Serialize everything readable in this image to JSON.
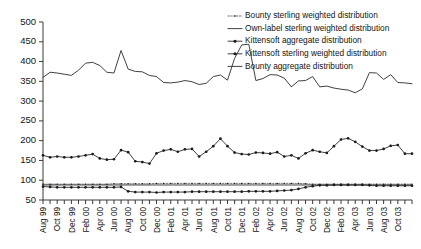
{
  "chart_data": {
    "type": "line",
    "title": "",
    "subtitle": "",
    "xlabel": "",
    "ylabel": "",
    "ylim": [
      50,
      500
    ],
    "ytick_step": 50,
    "yticks": [
      50,
      100,
      150,
      200,
      250,
      300,
      350,
      400,
      450,
      500
    ],
    "grid": false,
    "legend_position": "top-right",
    "x": [
      "Aug 99",
      "Sep 99",
      "Oct 99",
      "Nov 99",
      "Dec 99",
      "Jan 00",
      "Feb 00",
      "Mar 00",
      "Apr 00",
      "May 00",
      "Jun 00",
      "Jul 00",
      "Aug 00",
      "Sep 00",
      "Oct 00",
      "Nov 00",
      "Dec 00",
      "Jan 01",
      "Feb 01",
      "Mar 01",
      "Apr 01",
      "May 01",
      "Jun 01",
      "Jul 01",
      "Aug 01",
      "Sep 01",
      "Oct 01",
      "Nov 01",
      "Dec 01",
      "Jan 02",
      "Feb 02",
      "Mar 02",
      "Apr 02",
      "May 02",
      "Jun 02",
      "Jul 02",
      "Aug 02",
      "Sep 02",
      "Oct 02",
      "Nov 02",
      "Dec 02",
      "Jan 03",
      "Feb 03",
      "Mar 03",
      "Apr 03",
      "May 03",
      "Jun 03",
      "Jul 03",
      "Aug 03",
      "Sep 03",
      "Oct 03",
      "Nov 03",
      "Dec 03"
    ],
    "xtick_labels": [
      "Aug 99",
      "Oct 99",
      "Dec 99",
      "Feb 00",
      "Apr 00",
      "Jun 00",
      "Aug 00",
      "Oct 00",
      "Dec 00",
      "Feb 01",
      "Apr 01",
      "Jun 01",
      "Aug 01",
      "Oct 01",
      "Dec 01",
      "Feb 02",
      "Apr 02",
      "Jun 02",
      "Aug 02",
      "Oct 02",
      "Dec 02",
      "Feb 03",
      "Apr 03",
      "Jun 03",
      "Aug 03",
      "Oct 03"
    ],
    "xtick_every": 2,
    "series": [
      {
        "name": "Bounty sterling weighted distribution",
        "marker": "dot-small",
        "line": "thin",
        "values": [
          90,
          90,
          90,
          90,
          90,
          90,
          90,
          90,
          90,
          90,
          91,
          91,
          91,
          91,
          91,
          91,
          92,
          92,
          92,
          92,
          92,
          92,
          92,
          92,
          92,
          92,
          92,
          92,
          92,
          92,
          92,
          92,
          92,
          92,
          92,
          92,
          92,
          91,
          90,
          90,
          90,
          90,
          90,
          90,
          90,
          90,
          90,
          90,
          90,
          90,
          90,
          90,
          90
        ]
      },
      {
        "name": "Own-label sterling weighted distribution",
        "marker": "none",
        "line": "solid",
        "values": [
          88,
          88,
          88,
          88,
          88,
          88,
          88,
          88,
          88,
          88,
          88,
          88,
          88,
          88,
          88,
          88,
          88,
          88,
          88,
          88,
          88,
          88,
          88,
          88,
          88,
          88,
          88,
          88,
          88,
          88,
          88,
          88,
          88,
          88,
          88,
          88,
          88,
          88,
          88,
          88,
          88,
          88,
          88,
          88,
          88,
          88,
          88,
          88,
          88,
          88,
          88,
          88,
          88
        ]
      },
      {
        "name": "Kittensoft aggregate distribution",
        "marker": "dot",
        "line": "solid",
        "values": [
          163,
          158,
          160,
          158,
          158,
          160,
          163,
          166,
          155,
          152,
          153,
          176,
          171,
          148,
          146,
          142,
          168,
          175,
          178,
          172,
          178,
          179,
          160,
          172,
          186,
          205,
          186,
          170,
          166,
          165,
          170,
          169,
          167,
          171,
          160,
          163,
          155,
          168,
          176,
          172,
          169,
          186,
          203,
          206,
          197,
          185,
          175,
          175,
          179,
          187,
          189,
          167,
          167
        ]
      },
      {
        "name": "Kittensoft sterling weighted distribution",
        "marker": "dot",
        "line": "solid",
        "values": [
          84,
          83,
          82,
          82,
          82,
          82,
          82,
          82,
          82,
          82,
          82,
          83,
          72,
          70,
          70,
          70,
          69,
          70,
          70,
          70,
          70,
          71,
          71,
          71,
          71,
          71,
          71,
          71,
          71,
          72,
          72,
          72,
          72,
          73,
          74,
          75,
          78,
          82,
          85,
          87,
          87,
          88,
          88,
          88,
          88,
          88,
          87,
          86,
          86,
          86,
          86,
          86,
          86
        ]
      },
      {
        "name": "Bounty aggregate distribution",
        "marker": "none",
        "line": "solid",
        "values": [
          360,
          373,
          371,
          368,
          365,
          378,
          396,
          398,
          390,
          373,
          371,
          428,
          381,
          375,
          374,
          365,
          362,
          347,
          346,
          348,
          352,
          349,
          342,
          345,
          362,
          366,
          353,
          408,
          442,
          444,
          352,
          357,
          367,
          366,
          358,
          336,
          351,
          352,
          362,
          336,
          338,
          333,
          330,
          328,
          321,
          331,
          372,
          371,
          355,
          367,
          347,
          346,
          344
        ]
      }
    ],
    "legend": [
      {
        "label": "Bounty sterling weighted distribution",
        "marker": "dot-small",
        "line": "thin"
      },
      {
        "label": "Own-label sterling weighted distribution",
        "marker": "none",
        "line": "solid"
      },
      {
        "label": "Kittensoft aggregate distribution",
        "marker": "dot",
        "line": "solid"
      },
      {
        "label": "Kittensoft sterling weighted distribution",
        "marker": "dot",
        "line": "solid"
      },
      {
        "label": "Bounty aggregate distribution",
        "marker": "none",
        "line": "solid"
      }
    ]
  },
  "colors": {
    "axis": "#3a3a3a",
    "series": "#2b2b2b",
    "text": "#141414",
    "background": "#ffffff"
  }
}
